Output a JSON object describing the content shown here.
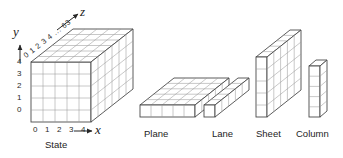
{
  "figure": {
    "title_state": "State",
    "axes": {
      "x": {
        "label": "x",
        "ticks": [
          "0",
          "1",
          "2",
          "3",
          "4"
        ],
        "arrow": "right-arrow-icon"
      },
      "y": {
        "label": "y",
        "ticks": [
          "4",
          "3",
          "2",
          "1",
          "0"
        ],
        "arrow": "up-arrow-icon"
      },
      "z": {
        "label": "z",
        "ticks": "0 1 2 3 4 ... 63",
        "arrow": "diagonal-arrow-icon"
      }
    },
    "parts": [
      {
        "name": "plane",
        "label": "Plane"
      },
      {
        "name": "lane",
        "label": "Lane"
      },
      {
        "name": "sheet",
        "label": "Sheet"
      },
      {
        "name": "column",
        "label": "Column"
      }
    ],
    "colors": {
      "stroke": "#3a3a3a",
      "stroke_light": "#8d8d8d",
      "fill": "#ffffff",
      "text": "#1d1d1d",
      "background": "#ffffff"
    },
    "geometry": {
      "state_x_cells": 5,
      "state_y_cells": 5,
      "state_z_cells": 6,
      "lane_length": 6,
      "sheet_height": 5,
      "column_height": 5
    }
  }
}
